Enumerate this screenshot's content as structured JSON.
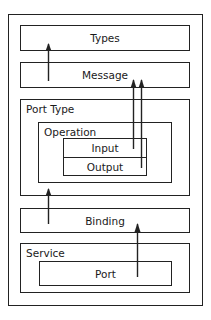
{
  "diagram": {
    "type": "nested-block-diagram",
    "outer_container": {
      "label": ""
    },
    "blocks": {
      "types": {
        "label": "Types"
      },
      "message": {
        "label": "Message"
      },
      "port_type": {
        "label": "Port Type",
        "operation": {
          "label": "Operation",
          "input": {
            "label": "Input"
          },
          "output": {
            "label": "Output"
          }
        }
      },
      "binding": {
        "label": "Binding"
      },
      "service": {
        "label": "Service",
        "port": {
          "label": "Port"
        }
      }
    },
    "arrows": [
      {
        "from": "Message",
        "to": "Types"
      },
      {
        "from": "Input",
        "to": "Message"
      },
      {
        "from": "Output",
        "to": "Message"
      },
      {
        "from": "Binding",
        "to": "Port Type"
      },
      {
        "from": "Port",
        "to": "Binding"
      }
    ],
    "colors": {
      "stroke": "#222222",
      "text": "#1a1a1a",
      "background": "#ffffff"
    }
  }
}
